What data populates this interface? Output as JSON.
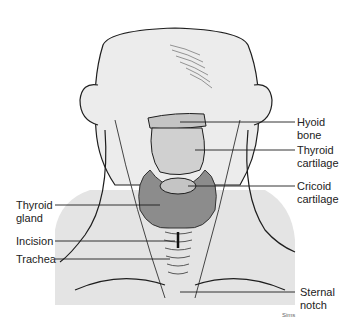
{
  "figure": {
    "credit": "Sims",
    "colors": {
      "panel": "#e4e4e4",
      "skin": "#ececec",
      "thyroid_gland": "#8c8c8c",
      "cartilage": "#c4c4c4",
      "line": "#1e1e1e"
    }
  },
  "labels": {
    "hyoid_bone": "Hyoid\nbone",
    "thyroid_cartilage": "Thyroid\ncartilage",
    "cricoid_cartilage": "Cricoid\ncartilage",
    "thyroid_gland": "Thyroid\ngland",
    "incision": "Incision",
    "trachea": "Trachea",
    "sternal_notch": "Sternal\nnotch"
  }
}
